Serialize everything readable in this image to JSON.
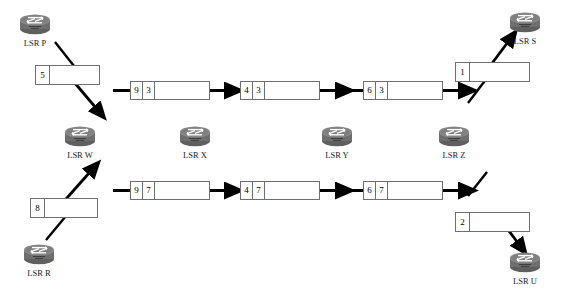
{
  "diagram": {
    "colors": {
      "stroke": "#000000",
      "box_border": "#6f6f6f",
      "router_body": "#7d7d7d",
      "router_top": "#9a9a9a",
      "router_dark": "#4f4f4f",
      "background": "#ffffff"
    }
  },
  "routers": [
    {
      "id": "p",
      "label": "LSR P",
      "x": 18,
      "y": 10
    },
    {
      "id": "w",
      "label": "LSR W",
      "x": 63,
      "y": 122
    },
    {
      "id": "x",
      "label": "LSR X",
      "x": 178,
      "y": 122
    },
    {
      "id": "y",
      "label": "LSR Y",
      "x": 320,
      "y": 122
    },
    {
      "id": "z",
      "label": "LSR Z",
      "x": 437,
      "y": 122
    },
    {
      "id": "s",
      "label": "LSR S",
      "x": 508,
      "y": 8
    },
    {
      "id": "r",
      "label": "LSR R",
      "x": 22,
      "y": 240
    },
    {
      "id": "u",
      "label": "LSR U",
      "x": 508,
      "y": 248
    }
  ],
  "packets": [
    {
      "id": "pkt-p-out",
      "row": "top",
      "x": 35,
      "y": 65,
      "w": 65,
      "h": 20,
      "cells": [
        {
          "value": "5",
          "w": 14
        }
      ]
    },
    {
      "id": "pkt-w-x",
      "row": "top",
      "x": 130,
      "y": 81,
      "w": 80,
      "h": 19,
      "cells": [
        {
          "value": "9",
          "w": 12
        },
        {
          "value": "3",
          "w": 12
        }
      ]
    },
    {
      "id": "pkt-x-y",
      "row": "top",
      "x": 240,
      "y": 81,
      "w": 80,
      "h": 19,
      "cells": [
        {
          "value": "4",
          "w": 12
        },
        {
          "value": "3",
          "w": 12
        }
      ]
    },
    {
      "id": "pkt-y-z",
      "row": "top",
      "x": 363,
      "y": 81,
      "w": 80,
      "h": 19,
      "cells": [
        {
          "value": "6",
          "w": 12
        },
        {
          "value": "3",
          "w": 12
        }
      ]
    },
    {
      "id": "pkt-z-s",
      "row": "top",
      "x": 455,
      "y": 62,
      "w": 75,
      "h": 20,
      "cells": [
        {
          "value": "1",
          "w": 14
        }
      ]
    },
    {
      "id": "pkt-r-out",
      "row": "bottom",
      "x": 30,
      "y": 198,
      "w": 68,
      "h": 20,
      "cells": [
        {
          "value": "8",
          "w": 14
        }
      ]
    },
    {
      "id": "pkt-w-x-b",
      "row": "bottom",
      "x": 130,
      "y": 181,
      "w": 80,
      "h": 19,
      "cells": [
        {
          "value": "9",
          "w": 12
        },
        {
          "value": "7",
          "w": 12
        }
      ]
    },
    {
      "id": "pkt-x-y-b",
      "row": "bottom",
      "x": 240,
      "y": 181,
      "w": 80,
      "h": 19,
      "cells": [
        {
          "value": "4",
          "w": 12
        },
        {
          "value": "7",
          "w": 12
        }
      ]
    },
    {
      "id": "pkt-y-z-b",
      "row": "bottom",
      "x": 363,
      "y": 181,
      "w": 80,
      "h": 19,
      "cells": [
        {
          "value": "6",
          "w": 12
        },
        {
          "value": "7",
          "w": 12
        }
      ]
    },
    {
      "id": "pkt-z-u",
      "row": "bottom",
      "x": 455,
      "y": 212,
      "w": 75,
      "h": 20,
      "cells": [
        {
          "value": "2",
          "w": 14
        }
      ]
    }
  ],
  "flows": {
    "top": [
      {
        "from": "LSR P",
        "to": "LSR W",
        "label_stack": [
          "5"
        ]
      },
      {
        "from": "LSR W",
        "to": "LSR X",
        "label_stack": [
          "9",
          "3"
        ]
      },
      {
        "from": "LSR X",
        "to": "LSR Y",
        "label_stack": [
          "4",
          "3"
        ]
      },
      {
        "from": "LSR Y",
        "to": "LSR Z",
        "label_stack": [
          "6",
          "3"
        ]
      },
      {
        "from": "LSR Z",
        "to": "LSR S",
        "label_stack": [
          "1"
        ]
      }
    ],
    "bottom": [
      {
        "from": "LSR R",
        "to": "LSR W",
        "label_stack": [
          "8"
        ]
      },
      {
        "from": "LSR W",
        "to": "LSR X",
        "label_stack": [
          "9",
          "7"
        ]
      },
      {
        "from": "LSR X",
        "to": "LSR Y",
        "label_stack": [
          "4",
          "7"
        ]
      },
      {
        "from": "LSR Y",
        "to": "LSR Z",
        "label_stack": [
          "6",
          "7"
        ]
      },
      {
        "from": "LSR Z",
        "to": "LSR U",
        "label_stack": [
          "2"
        ]
      }
    ]
  }
}
